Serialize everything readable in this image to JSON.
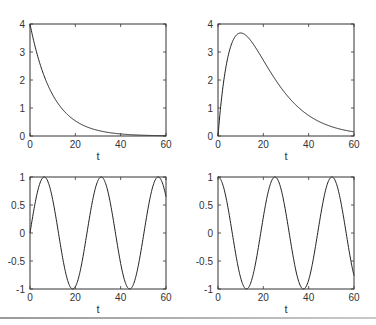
{
  "chart_data": [
    {
      "type": "line",
      "title": "",
      "xlabel": "t",
      "ylabel": "",
      "xlim": [
        0,
        60
      ],
      "ylim": [
        0,
        4
      ],
      "xticks": [
        0,
        20,
        40,
        60
      ],
      "yticks": [
        0,
        1,
        2,
        3,
        4
      ],
      "xtick_labels": [
        "0",
        "20",
        "40",
        "60"
      ],
      "ytick_labels": [
        "0",
        "1",
        "2",
        "3",
        "4"
      ],
      "grid": false,
      "series": [
        {
          "name": "exponential decay",
          "function": "4*exp(-t/10)",
          "x": [
            0,
            5,
            10,
            15,
            20,
            25,
            30,
            35,
            40,
            45,
            50,
            55,
            60
          ],
          "values": [
            4.0,
            2.43,
            1.47,
            0.89,
            0.54,
            0.33,
            0.2,
            0.12,
            0.07,
            0.04,
            0.03,
            0.02,
            0.01
          ]
        }
      ]
    },
    {
      "type": "line",
      "title": "",
      "xlabel": "t",
      "ylabel": "",
      "xlim": [
        0,
        60
      ],
      "ylim": [
        0,
        4
      ],
      "xticks": [
        0,
        20,
        40,
        60
      ],
      "yticks": [
        0,
        1,
        2,
        3,
        4
      ],
      "xtick_labels": [
        "0",
        "20",
        "40",
        "60"
      ],
      "ytick_labels": [
        "0",
        "1",
        "2",
        "3",
        "4"
      ],
      "grid": false,
      "series": [
        {
          "name": "rise and decay",
          "function": "t*exp(-t/10)",
          "x": [
            0,
            5,
            10,
            15,
            20,
            25,
            30,
            35,
            40,
            45,
            50,
            55,
            60
          ],
          "values": [
            0,
            3.03,
            3.68,
            3.35,
            2.71,
            2.05,
            1.49,
            1.06,
            0.73,
            0.5,
            0.34,
            0.22,
            0.15
          ]
        }
      ]
    },
    {
      "type": "line",
      "title": "",
      "xlabel": "t",
      "ylabel": "",
      "xlim": [
        0,
        60
      ],
      "ylim": [
        -1,
        1
      ],
      "xticks": [
        0,
        20,
        40,
        60
      ],
      "yticks": [
        -1,
        -0.5,
        0,
        0.5,
        1
      ],
      "xtick_labels": [
        "0",
        "20",
        "40",
        "60"
      ],
      "ytick_labels": [
        "-1",
        "-0.5",
        "0",
        "0.5",
        "1"
      ],
      "grid": false,
      "series": [
        {
          "name": "sine",
          "function": "sin(t/4)",
          "x": [
            0,
            5,
            10,
            15,
            20,
            25,
            30,
            35,
            40,
            45,
            50,
            55,
            60
          ],
          "values": [
            0,
            0.95,
            0.6,
            -0.57,
            -0.96,
            -0.03,
            0.94,
            0.63,
            -0.54,
            -0.98,
            -0.07,
            0.92,
            0.65
          ]
        }
      ]
    },
    {
      "type": "line",
      "title": "",
      "xlabel": "t",
      "ylabel": "",
      "xlim": [
        0,
        60
      ],
      "ylim": [
        -1,
        1
      ],
      "xticks": [
        0,
        20,
        40,
        60
      ],
      "yticks": [
        -1,
        -0.5,
        0,
        0.5,
        1
      ],
      "xtick_labels": [
        "0",
        "20",
        "40",
        "60"
      ],
      "ytick_labels": [
        "-1",
        "-0.5",
        "0",
        "0.5",
        "1"
      ],
      "grid": false,
      "series": [
        {
          "name": "cosine",
          "function": "cos(t/4)",
          "x": [
            0,
            5,
            10,
            15,
            20,
            25,
            30,
            35,
            40,
            45,
            50,
            55,
            60
          ],
          "values": [
            1,
            0.32,
            -0.8,
            -0.82,
            0.28,
            1.0,
            0.35,
            -0.78,
            -0.84,
            0.22,
            1.0,
            0.39,
            -0.76
          ]
        }
      ]
    }
  ]
}
